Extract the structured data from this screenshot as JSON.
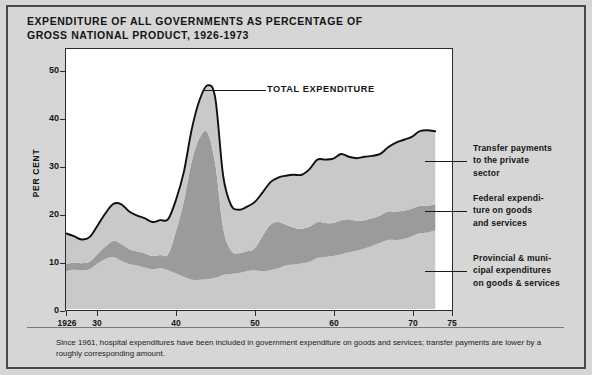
{
  "figure": {
    "title": "EXPENDITURE OF ALL GOVERNMENTS AS PERCENTAGE OF\nGROSS NATIONAL PRODUCT, 1926-1973",
    "footnote": "Since 1961, hospital expenditures have been included in government expenditure on goods and services; transfer payments are lower by a roughly corresponding amount.",
    "annotation_total": "TOTAL EXPENDITURE",
    "background_color": "#d6d6d6",
    "plot_background_color": "#ffffff",
    "frame_color": "#2b2b2b"
  },
  "axes": {
    "y_axis_title": "PER CENT",
    "y_ticks": [
      "0",
      "10",
      "20",
      "30",
      "40",
      "50"
    ],
    "y_tick_values": [
      0,
      10,
      20,
      30,
      40,
      50
    ],
    "y_range": [
      0,
      55
    ],
    "x_ticks": [
      "1926",
      "30",
      "40",
      "50",
      "60",
      "70",
      "75"
    ],
    "x_tick_values": [
      1926,
      1930,
      1940,
      1950,
      1960,
      1970,
      1975
    ],
    "x_range": [
      1926,
      1975
    ],
    "grid": false
  },
  "legend": {
    "position": "right-outside",
    "items": [
      {
        "label": "Transfer payments\nto the private\nsector",
        "color": "#c9c9c9",
        "series_key": "transfer_payments"
      },
      {
        "label": "Federal expendi-\nture on goods\nand services",
        "color": "#9b9b9b",
        "series_key": "federal_goods_services"
      },
      {
        "label": "Provincial & muni-\ncipal expenditures\non goods & services",
        "color": "#c9c9c9",
        "series_key": "provincial_municipal"
      }
    ]
  },
  "chart_data": {
    "type": "area",
    "stacked": true,
    "title": "EXPENDITURE OF ALL GOVERNMENTS AS PERCENTAGE OF GROSS NATIONAL PRODUCT, 1926-1973",
    "xlabel": "",
    "ylabel": "PER CENT",
    "xlim": [
      1926,
      1975
    ],
    "ylim": [
      0,
      55
    ],
    "x": [
      1926,
      1927,
      1928,
      1929,
      1930,
      1931,
      1932,
      1933,
      1934,
      1935,
      1936,
      1937,
      1938,
      1939,
      1940,
      1941,
      1942,
      1943,
      1944,
      1945,
      1946,
      1947,
      1948,
      1949,
      1950,
      1951,
      1952,
      1953,
      1954,
      1955,
      1956,
      1957,
      1958,
      1959,
      1960,
      1961,
      1962,
      1963,
      1964,
      1965,
      1966,
      1967,
      1968,
      1969,
      1970,
      1971,
      1972,
      1973
    ],
    "series": [
      {
        "name": "Provincial & municipal expenditures on goods & services",
        "color": "#c9c9c9",
        "order": "bottom",
        "values": [
          8.0,
          8.3,
          8.2,
          8.4,
          9.6,
          10.6,
          11.0,
          10.2,
          9.5,
          9.2,
          8.8,
          8.4,
          8.6,
          8.2,
          7.5,
          6.8,
          6.2,
          6.2,
          6.3,
          6.6,
          7.2,
          7.4,
          7.6,
          8.0,
          8.2,
          8.0,
          8.2,
          8.6,
          9.2,
          9.4,
          9.6,
          10.0,
          10.8,
          11.0,
          11.2,
          11.6,
          12.0,
          12.3,
          12.8,
          13.4,
          14.0,
          14.6,
          14.6,
          14.8,
          15.4,
          16.0,
          16.2,
          16.6
        ]
      },
      {
        "name": "Federal expenditure on goods and services",
        "color": "#9b9b9b",
        "order": "middle",
        "values": [
          1.6,
          1.5,
          1.5,
          1.6,
          2.0,
          2.6,
          3.4,
          3.6,
          3.2,
          3.0,
          3.0,
          2.8,
          2.8,
          3.4,
          9.0,
          16.0,
          25.0,
          30.0,
          31.0,
          24.0,
          10.0,
          5.0,
          4.2,
          4.2,
          4.6,
          7.4,
          9.6,
          9.8,
          8.6,
          7.8,
          7.4,
          7.4,
          7.6,
          7.2,
          7.0,
          7.2,
          7.0,
          6.4,
          6.0,
          5.8,
          5.8,
          6.0,
          6.0,
          6.0,
          5.8,
          5.8,
          5.6,
          5.6
        ]
      },
      {
        "name": "Transfer payments to the private sector",
        "color": "#c9c9c9",
        "order": "top",
        "values": [
          6.4,
          5.6,
          5.0,
          5.2,
          6.0,
          7.0,
          7.8,
          8.4,
          8.0,
          7.6,
          7.4,
          7.2,
          7.4,
          7.4,
          6.6,
          6.2,
          6.8,
          8.0,
          10.0,
          14.0,
          11.0,
          9.6,
          9.2,
          9.4,
          9.8,
          9.2,
          9.0,
          9.4,
          10.4,
          11.2,
          11.4,
          12.2,
          13.2,
          13.4,
          13.6,
          14.0,
          13.2,
          13.2,
          13.4,
          13.2,
          13.0,
          13.6,
          14.6,
          15.0,
          15.2,
          15.8,
          16.0,
          15.4
        ]
      }
    ],
    "total_expenditure": {
      "name": "TOTAL EXPENDITURE",
      "values": [
        16.0,
        15.4,
        14.7,
        15.2,
        17.6,
        20.2,
        22.2,
        22.2,
        20.7,
        19.8,
        19.2,
        18.4,
        18.8,
        19.0,
        23.1,
        29.0,
        38.0,
        44.2,
        47.3,
        44.6,
        28.2,
        22.0,
        21.0,
        21.6,
        22.6,
        24.6,
        26.8,
        27.8,
        28.2,
        28.4,
        28.4,
        29.6,
        31.6,
        31.6,
        31.8,
        32.8,
        32.2,
        31.9,
        32.2,
        32.4,
        32.8,
        34.2,
        35.2,
        35.8,
        36.4,
        37.6,
        37.8,
        37.6
      ]
    },
    "peak": {
      "year": 1944,
      "value": 54.5,
      "note": "wartime peak of outline"
    }
  }
}
